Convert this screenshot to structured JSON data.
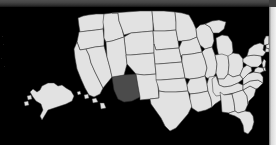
{
  "canvas": {
    "width": 276,
    "height": 145,
    "background_color": "#000000"
  },
  "chrome": {
    "top_band": {
      "name": "top-gradient-band",
      "height_px": 7,
      "color_top": "#4f4f4f",
      "color_bottom": "#141414"
    },
    "right_edge_strip": {
      "name": "right-edge-light-strip",
      "width_px": 7,
      "color": "#f2f2f2"
    }
  },
  "map": {
    "title": "United States",
    "projection": "albers-usa",
    "background_color": "#000000",
    "default_state_fill": "#e2e2e2",
    "state_border_color": "#3a3a3a",
    "selected_state_fill": "#4b4b4b",
    "selected_state": "Arizona",
    "selected_state_code": "AZ",
    "insets": [
      {
        "name": "Alaska",
        "code": "AK"
      },
      {
        "name": "Hawaii",
        "code": "HI"
      }
    ],
    "states": [
      {
        "code": "WA",
        "name": "Washington",
        "selected": false
      },
      {
        "code": "OR",
        "name": "Oregon",
        "selected": false
      },
      {
        "code": "CA",
        "name": "California",
        "selected": false
      },
      {
        "code": "NV",
        "name": "Nevada",
        "selected": false
      },
      {
        "code": "ID",
        "name": "Idaho",
        "selected": false
      },
      {
        "code": "MT",
        "name": "Montana",
        "selected": false
      },
      {
        "code": "WY",
        "name": "Wyoming",
        "selected": false
      },
      {
        "code": "UT",
        "name": "Utah",
        "selected": false
      },
      {
        "code": "AZ",
        "name": "Arizona",
        "selected": true
      },
      {
        "code": "CO",
        "name": "Colorado",
        "selected": false
      },
      {
        "code": "NM",
        "name": "New Mexico",
        "selected": false
      },
      {
        "code": "ND",
        "name": "North Dakota",
        "selected": false
      },
      {
        "code": "SD",
        "name": "South Dakota",
        "selected": false
      },
      {
        "code": "NE",
        "name": "Nebraska",
        "selected": false
      },
      {
        "code": "KS",
        "name": "Kansas",
        "selected": false
      },
      {
        "code": "OK",
        "name": "Oklahoma",
        "selected": false
      },
      {
        "code": "TX",
        "name": "Texas",
        "selected": false
      },
      {
        "code": "MN",
        "name": "Minnesota",
        "selected": false
      },
      {
        "code": "IA",
        "name": "Iowa",
        "selected": false
      },
      {
        "code": "MO",
        "name": "Missouri",
        "selected": false
      },
      {
        "code": "AR",
        "name": "Arkansas",
        "selected": false
      },
      {
        "code": "LA",
        "name": "Louisiana",
        "selected": false
      },
      {
        "code": "WI",
        "name": "Wisconsin",
        "selected": false
      },
      {
        "code": "IL",
        "name": "Illinois",
        "selected": false
      },
      {
        "code": "MS",
        "name": "Mississippi",
        "selected": false
      },
      {
        "code": "MI",
        "name": "Michigan",
        "selected": false
      },
      {
        "code": "IN",
        "name": "Indiana",
        "selected": false
      },
      {
        "code": "OH",
        "name": "Ohio",
        "selected": false
      },
      {
        "code": "KY",
        "name": "Kentucky",
        "selected": false
      },
      {
        "code": "TN",
        "name": "Tennessee",
        "selected": false
      },
      {
        "code": "AL",
        "name": "Alabama",
        "selected": false
      },
      {
        "code": "GA",
        "name": "Georgia",
        "selected": false
      },
      {
        "code": "FL",
        "name": "Florida",
        "selected": false
      },
      {
        "code": "SC",
        "name": "South Carolina",
        "selected": false
      },
      {
        "code": "NC",
        "name": "North Carolina",
        "selected": false
      },
      {
        "code": "VA",
        "name": "Virginia",
        "selected": false
      },
      {
        "code": "WV",
        "name": "West Virginia",
        "selected": false
      },
      {
        "code": "PA",
        "name": "Pennsylvania",
        "selected": false
      },
      {
        "code": "NY",
        "name": "New York",
        "selected": false
      },
      {
        "code": "VT",
        "name": "Vermont",
        "selected": false
      },
      {
        "code": "NH",
        "name": "New Hampshire",
        "selected": false
      },
      {
        "code": "ME",
        "name": "Maine",
        "selected": false
      },
      {
        "code": "MA",
        "name": "Massachusetts",
        "selected": false
      },
      {
        "code": "RI",
        "name": "Rhode Island",
        "selected": false
      },
      {
        "code": "CT",
        "name": "Connecticut",
        "selected": false
      },
      {
        "code": "NJ",
        "name": "New Jersey",
        "selected": false
      },
      {
        "code": "DE",
        "name": "Delaware",
        "selected": false
      },
      {
        "code": "MD",
        "name": "Maryland",
        "selected": false
      },
      {
        "code": "AK",
        "name": "Alaska",
        "selected": false
      },
      {
        "code": "HI",
        "name": "Hawaii",
        "selected": false
      }
    ]
  }
}
